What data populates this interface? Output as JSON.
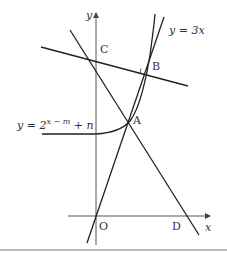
{
  "figure": {
    "axes": {
      "x_label": "x",
      "y_label": "y",
      "origin_label": "O"
    },
    "points": {
      "A": "A",
      "B": "B",
      "C": "C",
      "D": "D"
    },
    "curves": {
      "line_label": "y = 3x",
      "exp_label_base": "y = 2",
      "exp_label_exponent": "x − m",
      "exp_label_tail": " + n"
    },
    "colors": {
      "line": "#222222",
      "axis": "#555555",
      "rule": "#bbbbbb"
    }
  }
}
